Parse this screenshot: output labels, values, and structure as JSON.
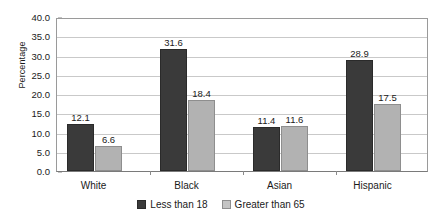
{
  "chart_data": {
    "type": "bar",
    "title": "",
    "subtitle": "",
    "xlabel": "",
    "ylabel": "Percentage",
    "ylim": [
      0.0,
      40.0
    ],
    "ytick_step": 5.0,
    "ytick_labels": [
      "0.0",
      "5.0",
      "10.0",
      "15.0",
      "20.0",
      "25.0",
      "30.0",
      "35.0",
      "40.0"
    ],
    "ytick_values": [
      0.0,
      5.0,
      10.0,
      15.0,
      20.0,
      25.0,
      30.0,
      35.0,
      40.0
    ],
    "grid": true,
    "grid_axis": "y",
    "legend_position": "bottom-center",
    "categories": [
      "White",
      "Black",
      "Asian",
      "Hispanic"
    ],
    "series": [
      {
        "name": "Less than 18",
        "color": "#3a3a3a",
        "values": [
          12.1,
          31.6,
          11.4,
          28.9
        ],
        "labels": [
          "12.1",
          "31.6",
          "11.4",
          "28.9"
        ]
      },
      {
        "name": "Greater than 65",
        "color": "#b2b2b2",
        "values": [
          6.6,
          18.4,
          11.6,
          17.5
        ],
        "labels": [
          "6.6",
          "18.4",
          "11.6",
          "17.5"
        ]
      }
    ]
  }
}
